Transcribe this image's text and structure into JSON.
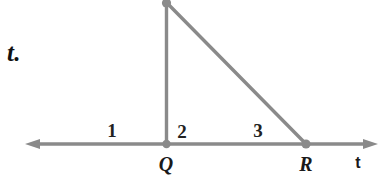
{
  "figure": {
    "type": "geometry-diagram",
    "background_color": "#ffffff",
    "stroke_color": "#8a8a8a",
    "text_color": "#1a1a1a",
    "stroke_width": 3.2,
    "text_fragment": "t.",
    "line": {
      "name": "t",
      "label": "t",
      "y": 144,
      "x_start": 25,
      "x_end": 378,
      "arrow_left": true,
      "arrow_right": true
    },
    "vertices": [
      {
        "id": "apex",
        "label": "",
        "x": 166,
        "y": 2,
        "dot": true
      },
      {
        "id": "Q",
        "label": "Q",
        "x": 166,
        "y": 144,
        "dot": true,
        "label_x": 166,
        "label_y": 164
      },
      {
        "id": "R",
        "label": "R",
        "x": 306,
        "y": 144,
        "dot": true,
        "label_x": 306,
        "label_y": 164
      }
    ],
    "segments": [
      {
        "id": "apex-Q",
        "from": "apex",
        "to": "Q"
      },
      {
        "id": "apex-R",
        "from": "apex",
        "to": "R"
      }
    ],
    "angle_labels": [
      {
        "id": "angle-1",
        "text": "1",
        "x": 112,
        "y": 130
      },
      {
        "id": "angle-2",
        "text": "2",
        "x": 182,
        "y": 131
      },
      {
        "id": "angle-3",
        "text": "3",
        "x": 258,
        "y": 130
      }
    ],
    "line_label": {
      "text": "t",
      "x": 358,
      "y": 163
    }
  }
}
